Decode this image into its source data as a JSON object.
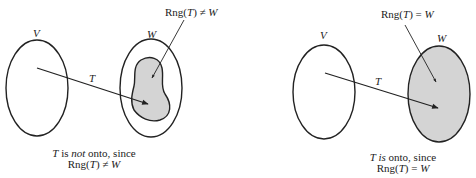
{
  "left_panel": {
    "domain_label": "V",
    "codomain_label": "W",
    "map_label": "T",
    "range_callout": {
      "prefix": "Rng(",
      "var": "T",
      "suffix": ") ≠ ",
      "set": "W"
    },
    "caption_line1": {
      "var": "T",
      "is": " is ",
      "not": "not",
      "rest": " onto, since"
    },
    "caption_line2": {
      "prefix": "Rng(",
      "var": "T",
      "suffix": ") ≠ ",
      "set": "W"
    }
  },
  "right_panel": {
    "domain_label": "V",
    "codomain_label": "W",
    "map_label": "T",
    "range_callout": {
      "prefix": "Rng(",
      "var": "T",
      "suffix": ") = ",
      "set": "W"
    },
    "caption_line1": {
      "var": "T",
      "is": " is",
      "rest": " onto, since"
    },
    "caption_line2": {
      "prefix": "Rng(",
      "var": "T",
      "suffix": ") = ",
      "set": "W"
    }
  },
  "colors": {
    "stroke": "#222222",
    "range_fill": "#d4d4d4",
    "background": "#ffffff"
  }
}
